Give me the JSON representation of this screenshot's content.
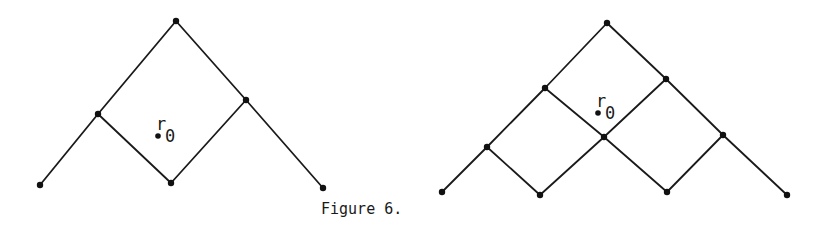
{
  "caption": "Figure 6.",
  "diagrams": [
    {
      "name": "left-lattice",
      "nodes": [
        {
          "id": "top",
          "x": 176,
          "y": 21
        },
        {
          "id": "lm",
          "x": 98,
          "y": 114
        },
        {
          "id": "rm",
          "x": 246,
          "y": 100
        },
        {
          "id": "bot",
          "x": 171,
          "y": 183
        },
        {
          "id": "fl",
          "x": 40,
          "y": 185
        },
        {
          "id": "fr",
          "x": 323,
          "y": 188
        }
      ],
      "edges": [
        [
          "top",
          "lm"
        ],
        [
          "top",
          "rm"
        ],
        [
          "lm",
          "fl"
        ],
        [
          "lm",
          "bot"
        ],
        [
          "bot",
          "rm"
        ],
        [
          "rm",
          "fr"
        ]
      ],
      "point": {
        "label": "r",
        "sub": "0",
        "x": 158,
        "y": 136
      }
    },
    {
      "name": "right-lattice",
      "nodes": [
        {
          "id": "top",
          "x": 607,
          "y": 23
        },
        {
          "id": "lm",
          "x": 545,
          "y": 88
        },
        {
          "id": "rm",
          "x": 666,
          "y": 79
        },
        {
          "id": "llm",
          "x": 487,
          "y": 147
        },
        {
          "id": "c",
          "x": 604,
          "y": 137
        },
        {
          "id": "rlm",
          "x": 723,
          "y": 135
        },
        {
          "id": "b1",
          "x": 442,
          "y": 192
        },
        {
          "id": "b2",
          "x": 540,
          "y": 195
        },
        {
          "id": "b3",
          "x": 667,
          "y": 192
        },
        {
          "id": "b4",
          "x": 787,
          "y": 195
        }
      ],
      "edges": [
        [
          "top",
          "lm"
        ],
        [
          "top",
          "rm"
        ],
        [
          "lm",
          "llm"
        ],
        [
          "lm",
          "c"
        ],
        [
          "rm",
          "c"
        ],
        [
          "rm",
          "rlm"
        ],
        [
          "llm",
          "b1"
        ],
        [
          "llm",
          "b2"
        ],
        [
          "b2",
          "c"
        ],
        [
          "c",
          "b3"
        ],
        [
          "b3",
          "rlm"
        ],
        [
          "rlm",
          "b4"
        ]
      ],
      "point": {
        "label": "r",
        "sub": "0",
        "x": 598,
        "y": 113
      }
    }
  ]
}
